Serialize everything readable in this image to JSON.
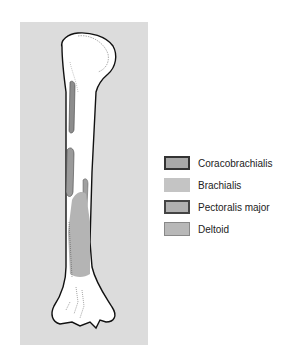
{
  "figure": {
    "background_color": "#dcdcdc"
  },
  "legend": {
    "items": [
      {
        "label": "Coracobrachialis",
        "fill": "#a8a8a8",
        "border": "#333333"
      },
      {
        "label": "Brachialis",
        "fill": "#c4c4c4",
        "border": "#c4c4c4"
      },
      {
        "label": "Pectoralis major",
        "fill": "#b0b0b0",
        "border": "#444444"
      },
      {
        "label": "Deltoid",
        "fill": "#b8b8b8",
        "border": "#888888"
      }
    ]
  }
}
